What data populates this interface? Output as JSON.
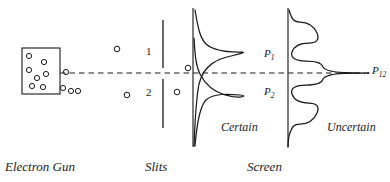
{
  "figure": {
    "background_color": "#ffffff",
    "ink_color": "#1a1a1a",
    "width": 390,
    "height": 182
  },
  "stage_labels": {
    "gun": "Electron Gun",
    "slits": "Slits",
    "screen": "Screen"
  },
  "region_labels": {
    "certain": "Certain",
    "uncertain": "Uncertain"
  },
  "slit_numbers": {
    "upper": "1",
    "lower": "2"
  },
  "probability_labels": {
    "p1": "P",
    "p1_sub": "1",
    "p2": "P",
    "p2_sub": "2",
    "p12": "P",
    "p12_sub": "12"
  },
  "axis": {
    "style": "dashed",
    "y": 73
  },
  "elements": {
    "gun_box": "electron-gun-box",
    "barrier": "slit-barrier",
    "screen_one": "screen-line-certain",
    "screen_two": "screen-line-uncertain"
  },
  "electrons": {
    "inside_gun": 7,
    "outside_gun": 4,
    "between_slits": 2,
    "past_slits": 2
  }
}
